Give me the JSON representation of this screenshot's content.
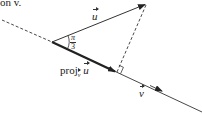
{
  "caption_fragment": "on  v.",
  "labels": {
    "u_vector": "u",
    "angle": {
      "numerator": "π",
      "denominator": "3"
    },
    "projection_prefix": "proj",
    "projection_subscript": "v",
    "projection_vector": "u",
    "v_vector": "v"
  },
  "colors": {
    "ink": "#222222",
    "background": "#ffffff"
  }
}
